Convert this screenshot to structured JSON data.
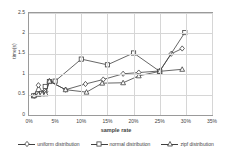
{
  "chart_data": {
    "type": "line",
    "title": "",
    "xlabel": "sample rate",
    "ylabel": "time(s)",
    "xlim": [
      0,
      35
    ],
    "ylim": [
      0,
      2.5
    ],
    "xunit": "%",
    "grid": true,
    "legend_position": "bottom",
    "xticks": [
      "0%",
      "5%",
      "10%",
      "15%",
      "20%",
      "25%",
      "30%",
      "35%"
    ],
    "yticks": [
      "0",
      "0.5",
      "1",
      "1.5",
      "2",
      "2.5"
    ],
    "series": [
      {
        "name": "uniform distribution",
        "marker": "diamond",
        "points": [
          [
            1.0,
            0.47
          ],
          [
            1.8,
            0.73
          ],
          [
            2.6,
            0.54
          ],
          [
            3.2,
            0.57
          ],
          [
            3.9,
            0.83
          ],
          [
            7.0,
            0.62
          ],
          [
            10.8,
            0.76
          ],
          [
            14.2,
            0.87
          ],
          [
            18.0,
            1.01
          ],
          [
            21.0,
            1.04
          ],
          [
            25.0,
            1.08
          ],
          [
            27.2,
            1.5
          ],
          [
            29.3,
            1.63
          ]
        ]
      },
      {
        "name": "normal distribution",
        "marker": "square",
        "points": [
          [
            0.9,
            0.47
          ],
          [
            1.7,
            0.52
          ],
          [
            2.4,
            0.53
          ],
          [
            3.1,
            0.7
          ],
          [
            3.9,
            0.82
          ],
          [
            5.0,
            0.83
          ],
          [
            10.0,
            1.37
          ],
          [
            15.0,
            1.23
          ],
          [
            20.0,
            1.52
          ],
          [
            25.0,
            1.07
          ],
          [
            29.8,
            2.02
          ]
        ]
      },
      {
        "name": "zipf distribution",
        "marker": "triangle",
        "points": [
          [
            1.0,
            0.48
          ],
          [
            1.8,
            0.51
          ],
          [
            2.5,
            0.52
          ],
          [
            3.2,
            0.52
          ],
          [
            3.9,
            0.83
          ],
          [
            7.0,
            0.62
          ],
          [
            11.0,
            0.56
          ],
          [
            14.0,
            0.78
          ],
          [
            18.0,
            0.79
          ],
          [
            21.0,
            0.96
          ],
          [
            25.0,
            1.07
          ],
          [
            29.3,
            1.12
          ]
        ]
      }
    ]
  },
  "legend": {
    "items": [
      {
        "label": "uniform distribution",
        "marker": "diamond"
      },
      {
        "label": "normal distribution",
        "marker": "square"
      },
      {
        "label": "zipf distribution",
        "marker": "triangle"
      }
    ]
  }
}
